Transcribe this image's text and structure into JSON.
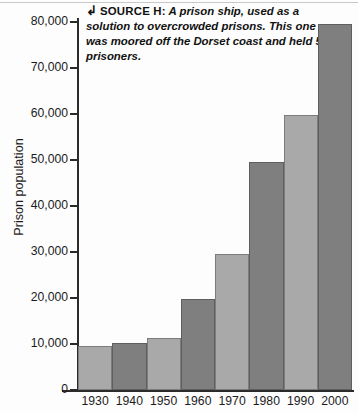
{
  "figure": {
    "source_icon": "hook-arrow-icon",
    "source_label": "SOURCE H:",
    "source_text": "A prison ship, used as a solution to overcrowded prisons. This one was moored off the Dorset coast and held 500 prisoners."
  },
  "colors": {
    "bar_light": "#a9a9a9",
    "bar_dark": "#7f7f7f",
    "axis": "#2b2b2b",
    "background": "#fdfdfd"
  },
  "chart_data": {
    "type": "bar",
    "title": "",
    "xlabel": "",
    "ylabel": "Prison population",
    "categories": [
      "1930",
      "1940",
      "1950",
      "1960",
      "1970",
      "1980",
      "1990",
      "2000"
    ],
    "values": [
      9500,
      10200,
      11200,
      19700,
      29500,
      49500,
      59700,
      79500
    ],
    "ylim": [
      0,
      80000
    ],
    "yticks": [
      0,
      10000,
      20000,
      30000,
      40000,
      50000,
      60000,
      70000,
      80000
    ],
    "ytick_labels": [
      "0",
      "10,000",
      "20,000",
      "30,000",
      "40,000",
      "50,000",
      "60,000",
      "70,000",
      "80,000"
    ],
    "bar_shades": [
      "light",
      "dark",
      "light",
      "dark",
      "light",
      "dark",
      "light",
      "dark"
    ],
    "grid": false,
    "legend": false
  }
}
